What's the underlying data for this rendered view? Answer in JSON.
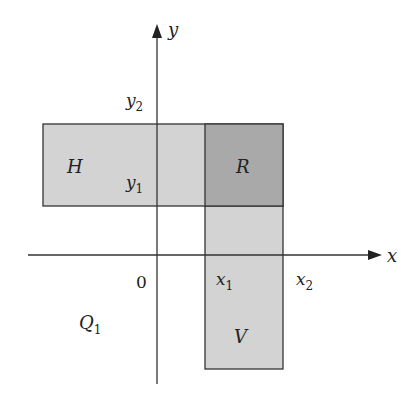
{
  "diagram": {
    "axes": {
      "x_label": "x",
      "y_label": "y",
      "origin_label": "0"
    },
    "ticks": {
      "x1": "x",
      "x1_sub": "1",
      "x2": "x",
      "x2_sub": "2",
      "y1": "y",
      "y1_sub": "1",
      "y2": "y",
      "y2_sub": "2"
    },
    "regions": {
      "H": {
        "label": "H",
        "fill": "#d3d3d3"
      },
      "R": {
        "label": "R",
        "fill": "#a9a9a9"
      },
      "V": {
        "label": "V",
        "fill": "#d3d3d3"
      },
      "Q1": {
        "label": "Q",
        "sub": "1"
      }
    },
    "colors": {
      "stroke": "#333333",
      "light_fill": "#d3d3d3",
      "dark_fill": "#a9a9a9"
    }
  }
}
